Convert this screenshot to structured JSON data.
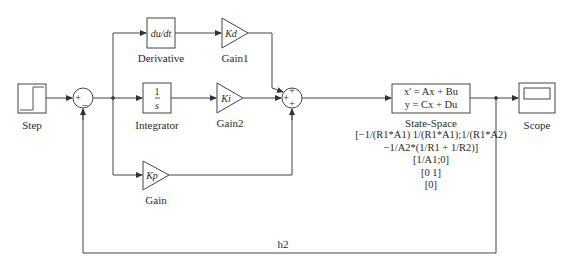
{
  "diagram": {
    "type": "simulink-block-diagram",
    "line_color": "#333333",
    "blocks": [
      {
        "id": "step",
        "label": "Step"
      },
      {
        "id": "sum1",
        "signs": [
          "+",
          "–"
        ]
      },
      {
        "id": "derivative",
        "label": "Derivative",
        "content": "du/dt"
      },
      {
        "id": "integrator",
        "label": "Integrator",
        "numerator": "1",
        "denominator": "s"
      },
      {
        "id": "gain1",
        "label": "Gain1",
        "content": "Kd"
      },
      {
        "id": "gain2",
        "label": "Gain2",
        "content": "Ki"
      },
      {
        "id": "gain",
        "label": "Gain",
        "content": "Kp"
      },
      {
        "id": "sum2",
        "signs": [
          "+",
          "+",
          "+"
        ]
      },
      {
        "id": "state_space",
        "label": "State-Space",
        "eq1": "x' = Ax + Bu",
        "eq2": "y = Cx + Du",
        "params": [
          "[−1/(R1*A1) 1/(R1*A1);1/(R1*A2)",
          "−1/A2*(1/R1 + 1/R2)]",
          "[1/A1;0]",
          "[0 1]",
          "[0]"
        ]
      },
      {
        "id": "scope",
        "label": "Scope"
      }
    ],
    "feedback_label": "h2"
  }
}
